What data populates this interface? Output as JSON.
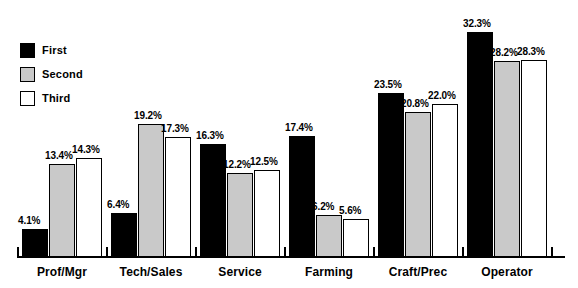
{
  "chart_data": {
    "type": "bar",
    "title": "",
    "subtitle": "",
    "xlabel": "",
    "ylabel": "",
    "ylim": [
      0,
      34
    ],
    "grid": false,
    "legend_position": "top-left",
    "value_suffix": "%",
    "categories": [
      "Prof/Mgr",
      "Tech/Sales",
      "Service",
      "Farming",
      "Craft/Prec",
      "Operator"
    ],
    "series": [
      {
        "name": "First",
        "color": "#000000",
        "values": [
          4.1,
          6.4,
          16.3,
          17.4,
          23.5,
          32.3
        ],
        "labels": [
          "4.1%",
          "6.4%",
          "16.3%",
          "17.4%",
          "23.5%",
          "32.3%"
        ]
      },
      {
        "name": "Second",
        "color": "#c9c9c9",
        "values": [
          13.4,
          19.2,
          12.2,
          6.2,
          20.8,
          28.2
        ],
        "labels": [
          "13.4%",
          "19.2%",
          "12.2%",
          "6.2%",
          "20.8%",
          "28.2%"
        ]
      },
      {
        "name": "Third",
        "color": "#ffffff",
        "values": [
          14.3,
          17.3,
          12.5,
          5.6,
          22.0,
          28.3
        ],
        "labels": [
          "14.3%",
          "17.3%",
          "12.5%",
          "5.6%",
          "22.0%",
          "28.3%"
        ]
      }
    ]
  },
  "legend": {
    "items": [
      {
        "label": "First",
        "swatch": "black-square-icon"
      },
      {
        "label": "Second",
        "swatch": "gray-square-icon"
      },
      {
        "label": "Third",
        "swatch": "white-square-icon"
      }
    ]
  },
  "axis": {
    "categories": [
      "Prof/Mgr",
      "Tech/Sales",
      "Service",
      "Farming",
      "Craft/Prec",
      "Operator"
    ]
  }
}
